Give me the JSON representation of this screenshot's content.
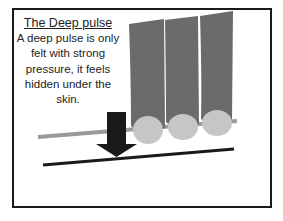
{
  "title": "The Deep pulse",
  "description": "A deep pulse is only felt with strong pressure, it feels hidden under the skin.",
  "diagram": {
    "elements": [
      "three-fingers",
      "finger-nails",
      "skin-surface-line",
      "deep-level-line",
      "down-arrow"
    ],
    "colors": {
      "finger": "#6b6b6b",
      "nail": "#c6c6c6",
      "skin_line": "#9a9a9a",
      "deep_line": "#1a1a1a",
      "arrow": "#1a1a1a",
      "border": "#1a1a1a"
    }
  }
}
